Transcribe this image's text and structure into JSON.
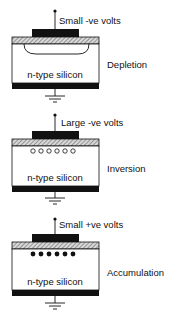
{
  "diagram": {
    "panels": [
      {
        "id": "depletion",
        "voltage_label": "Small -ve volts",
        "state_label": "Depletion",
        "substrate_label": "n-type silicon",
        "carrier_type": "depletion-region"
      },
      {
        "id": "inversion",
        "voltage_label": "Large -ve volts",
        "state_label": "Inversion",
        "substrate_label": "n-type silicon",
        "carrier_type": "holes",
        "carrier_count": 6
      },
      {
        "id": "accumulation",
        "voltage_label": "Small +ve volts",
        "state_label": "Accumulation",
        "substrate_label": "n-type silicon",
        "carrier_type": "electrons",
        "carrier_count": 6
      }
    ],
    "colors": {
      "line": "#111111",
      "gate": "#111111",
      "oxide_hatch": "#777777",
      "background": "#ffffff"
    }
  }
}
